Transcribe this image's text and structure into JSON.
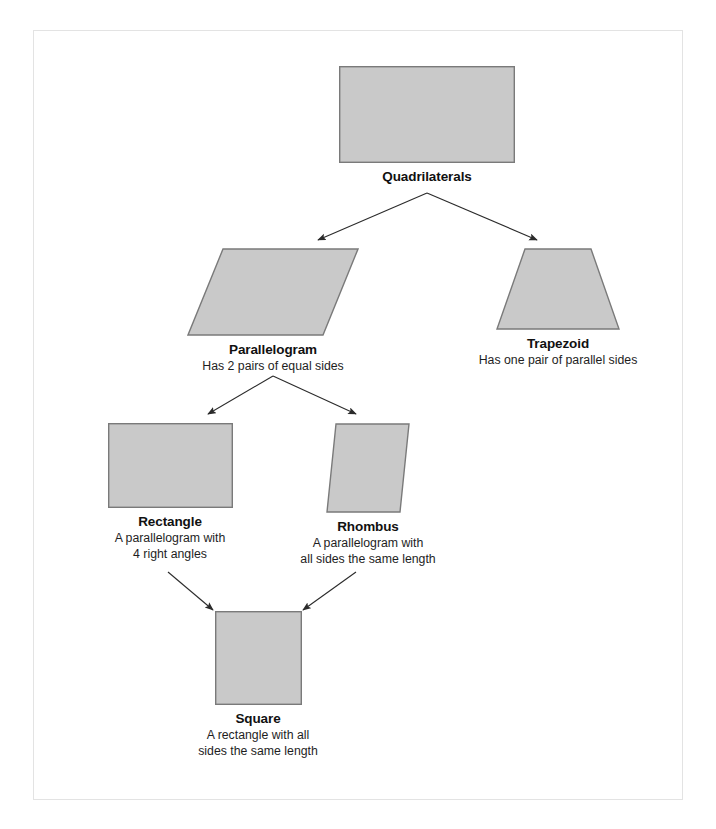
{
  "diagram": {
    "title_node": "Quadrilaterals",
    "shape_fill": "#c9c9c9",
    "shape_stroke": "#7a7a7a",
    "frame_color": "#e3e3e3",
    "connector_color": "#2b2b2b",
    "nodes": [
      {
        "id": "quadrilaterals",
        "label": "Quadrilaterals",
        "description": "",
        "shape": "rectangle"
      },
      {
        "id": "parallelogram",
        "label": "Parallelogram",
        "description": "Has 2 pairs of equal sides",
        "shape": "parallelogram"
      },
      {
        "id": "trapezoid",
        "label": "Trapezoid",
        "description": "Has one pair of parallel sides",
        "shape": "trapezoid"
      },
      {
        "id": "rectangle",
        "label": "Rectangle",
        "description": "A parallelogram with\n4 right angles",
        "shape": "rectangle"
      },
      {
        "id": "rhombus",
        "label": "Rhombus",
        "description": "A parallelogram with\nall sides the same length",
        "shape": "rhombus"
      },
      {
        "id": "square",
        "label": "Square",
        "description": "A rectangle with all\nsides the same length",
        "shape": "square"
      }
    ],
    "edges": [
      {
        "from": "quadrilaterals",
        "to": "parallelogram"
      },
      {
        "from": "quadrilaterals",
        "to": "trapezoid"
      },
      {
        "from": "parallelogram",
        "to": "rectangle"
      },
      {
        "from": "parallelogram",
        "to": "rhombus"
      },
      {
        "from": "rectangle",
        "to": "square"
      },
      {
        "from": "rhombus",
        "to": "square"
      }
    ]
  }
}
